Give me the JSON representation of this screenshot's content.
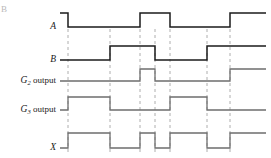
{
  "figure": {
    "corner_mark": "B",
    "type": "digital-timing-diagram",
    "width": 271,
    "height": 158,
    "background": "#ffffff",
    "dark_trace_color": "#1b1b1b",
    "gray_trace_color": "#6e6e6e",
    "gridline_color": "#9a9a9a"
  },
  "axis": {
    "time_start": 0,
    "time_end": 12,
    "x_start_px": 60,
    "x_end_px": 266,
    "gridline_times": [
      1,
      3,
      4.75,
      5.6,
      6.5,
      8.75,
      10.1
    ],
    "gridline_px": [
      68,
      110,
      140,
      155,
      170,
      207,
      230
    ]
  },
  "signals": [
    {
      "name": "A",
      "label_html": "A",
      "label_main": "A",
      "label_sub": "",
      "label_suffix": "",
      "style": "dark",
      "high_px": 13,
      "low_px": 27,
      "initial_level": 1,
      "transitions_px": [
        68,
        140,
        170,
        230
      ],
      "levels": [
        1,
        0,
        1,
        0,
        1
      ],
      "description": "Input A: high, low, high, low, high"
    },
    {
      "name": "B",
      "label_html": "B",
      "label_main": "B",
      "label_sub": "",
      "label_suffix": "",
      "style": "dark",
      "high_px": 46,
      "low_px": 60,
      "initial_level": 0,
      "transitions_px": [
        110,
        155,
        207
      ],
      "levels": [
        0,
        1,
        0,
        1
      ],
      "description": "Input B: low, high, low, high"
    },
    {
      "name": "G2 output",
      "label_html": "G2 output",
      "label_main": "G",
      "label_sub": "2",
      "label_suffix": "output",
      "style": "gray",
      "high_px": 69,
      "low_px": 81,
      "initial_level": 0,
      "transitions_px": [
        140,
        155,
        230
      ],
      "levels": [
        0,
        1,
        0,
        1
      ],
      "description": "G2 output: low, narrow high pulse, low, high"
    },
    {
      "name": "G3 output",
      "label_html": "G3 output",
      "label_main": "G",
      "label_sub": "3",
      "label_suffix": "output",
      "style": "gray",
      "high_px": 97,
      "low_px": 110,
      "initial_level": 0,
      "transitions_px": [
        68,
        110,
        170,
        207
      ],
      "levels": [
        0,
        1,
        0,
        1,
        0
      ],
      "description": "G3 output: low, high, low, high, low"
    },
    {
      "name": "X",
      "label_html": "X",
      "label_main": "X",
      "label_sub": "",
      "label_suffix": "",
      "style": "gray",
      "high_px": 133,
      "low_px": 148,
      "initial_level": 0,
      "transitions_px": [
        68,
        110,
        140,
        155,
        170,
        207,
        230
      ],
      "levels": [
        0,
        1,
        0,
        1,
        0,
        1,
        0,
        1
      ],
      "description": "Output X: alternating, toggling at every gridline"
    }
  ],
  "chart_data": {
    "type": "line",
    "title": "",
    "xlabel": "",
    "ylabel": "",
    "legend": [
      "A",
      "B",
      "G2 output",
      "G3 output",
      "X"
    ],
    "grid": true,
    "x": [
      0,
      68,
      110,
      140,
      155,
      170,
      207,
      230,
      266
    ],
    "series": [
      {
        "name": "A",
        "values": [
          1,
          0,
          0,
          1,
          1,
          0,
          0,
          1,
          1
        ]
      },
      {
        "name": "B",
        "values": [
          0,
          0,
          1,
          1,
          0,
          0,
          1,
          1,
          1
        ]
      },
      {
        "name": "G2 output",
        "values": [
          0,
          0,
          0,
          1,
          0,
          0,
          0,
          1,
          1
        ]
      },
      {
        "name": "G3 output",
        "values": [
          0,
          1,
          0,
          0,
          0,
          1,
          0,
          0,
          0
        ]
      },
      {
        "name": "X",
        "values": [
          0,
          1,
          0,
          1,
          0,
          1,
          0,
          1,
          1
        ]
      }
    ]
  }
}
